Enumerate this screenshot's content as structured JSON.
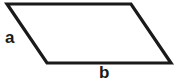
{
  "figure": {
    "type": "geometry-diagram",
    "shape_name": "parallelogram",
    "background_color": "#ffffff",
    "stroke_color": "#1a1a1a",
    "stroke_width": 3.2,
    "fill_color": "#ffffff",
    "canvas": {
      "width": 177,
      "height": 84
    },
    "vertices": [
      {
        "name": "top-left",
        "x": 7,
        "y": 4
      },
      {
        "name": "top-right",
        "x": 131,
        "y": 4
      },
      {
        "name": "bottom-right",
        "x": 171,
        "y": 63
      },
      {
        "name": "bottom-left",
        "x": 47,
        "y": 63
      }
    ],
    "polygon_points": "7,4 131,4 171,63 47,63",
    "labels": {
      "left_side": "a",
      "bottom_side": "b"
    },
    "label_color": "#1a1a1a"
  }
}
